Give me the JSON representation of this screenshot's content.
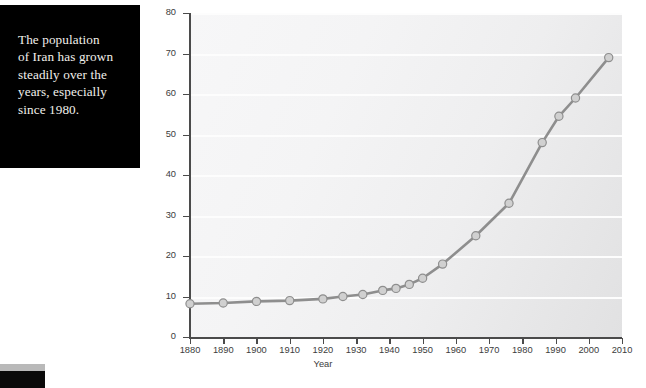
{
  "caption": {
    "text": "The population\nof Iran has grown\nsteadily over the\nyears, especially\nsince 1980."
  },
  "colors": {
    "caption_background": "#000000",
    "caption_text": "#f2f0ec",
    "line": "#8e8e8e",
    "marker_fill": "#d0d0d0",
    "marker_stroke": "#8e8e8e",
    "axis": "#4b4b4b",
    "gridline": "#fdfdfd",
    "plot_background": "#f2f2f3"
  },
  "chart_data": {
    "type": "line",
    "title": "",
    "xlabel": "Year",
    "ylabel": "Millions",
    "xlim": [
      1880,
      2010
    ],
    "ylim": [
      0,
      80
    ],
    "xticks": [
      1880,
      1890,
      1900,
      1910,
      1920,
      1930,
      1940,
      1950,
      1960,
      1970,
      1980,
      1990,
      2000,
      2010
    ],
    "yticks": [
      0,
      10,
      20,
      30,
      40,
      50,
      60,
      70,
      80
    ],
    "grid": "horizontal",
    "legend": "none",
    "x": [
      1880,
      1890,
      1900,
      1910,
      1920,
      1926,
      1932,
      1938,
      1942,
      1946,
      1950,
      1956,
      1966,
      1976,
      1986,
      1991,
      1996,
      2006
    ],
    "values": [
      8.2,
      8.4,
      8.8,
      9.0,
      9.4,
      10.0,
      10.5,
      11.5,
      12.0,
      13.0,
      14.5,
      18.0,
      25.0,
      33.0,
      48.0,
      54.5,
      59.0,
      69.0
    ],
    "series_name": "Population of Iran"
  }
}
